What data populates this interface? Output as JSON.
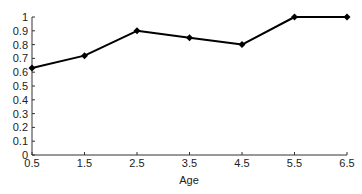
{
  "chart_data": {
    "type": "line",
    "title": "",
    "xlabel": "Age",
    "ylabel": "",
    "x": [
      0.5,
      1.5,
      2.5,
      3.5,
      4.5,
      5.5,
      6.5
    ],
    "series": [
      {
        "name": "",
        "values": [
          0.63,
          0.72,
          0.9,
          0.85,
          0.8,
          1.0,
          1.0
        ],
        "color": "#000000",
        "marker": "diamond"
      }
    ],
    "xlim": [
      0.5,
      6.5
    ],
    "ylim": [
      0,
      1
    ],
    "x_ticks": [
      "0.5",
      "1.5",
      "2.5",
      "3.5",
      "4.5",
      "5.5",
      "6.5"
    ],
    "y_ticks": [
      "0",
      "0.1",
      "0.2",
      "0.3",
      "0.4",
      "0.5",
      "0.6",
      "0.7",
      "0.8",
      "0.9",
      "1"
    ],
    "grid": false,
    "legend": "none"
  }
}
